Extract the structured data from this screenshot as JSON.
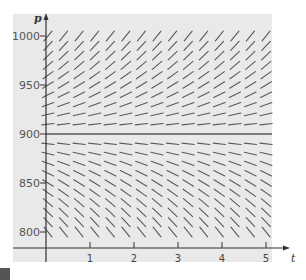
{
  "figure": {
    "type": "slope_field",
    "panel_color": "#e9e9e9",
    "segment_color": "#5a5a5a",
    "axis_color": "#333333",
    "equilibrium_color": "#555555",
    "axes": {
      "x_label": "t",
      "y_label": "p",
      "x_ticks": [
        "1",
        "2",
        "3",
        "4",
        "5"
      ],
      "y_ticks": [
        "800",
        "850",
        "900",
        "950",
        "1000"
      ]
    },
    "equilibrium": {
      "p": 900,
      "description": "horizontal equilibrium solution p = 900"
    }
  },
  "chart_data": {
    "type": "slope_field",
    "title": "",
    "xlabel": "t",
    "ylabel": "p",
    "xlim": [
      0,
      5.2
    ],
    "ylim": [
      795,
      1005
    ],
    "x_ticks": [
      1,
      2,
      3,
      4,
      5
    ],
    "y_ticks": [
      800,
      850,
      900,
      950,
      1000
    ],
    "grid": false,
    "equilibrium_line": 900,
    "t_samples": [
      0,
      0.35,
      0.7,
      1.05,
      1.4,
      1.75,
      2.1,
      2.45,
      2.8,
      3.15,
      3.5,
      3.85,
      4.2,
      4.55,
      4.9
    ],
    "p_samples_upper": [
      1000,
      990,
      980,
      970,
      960,
      950,
      940,
      930,
      920,
      910
    ],
    "p_samples_lower": [
      890,
      880,
      870,
      860,
      850,
      840,
      830,
      820,
      810,
      800
    ],
    "slope_model": "dp/dt proportional to (p - 900); positive above 900, negative below, zero at 900",
    "slope_sign_above": "positive",
    "slope_sign_below": "negative"
  }
}
